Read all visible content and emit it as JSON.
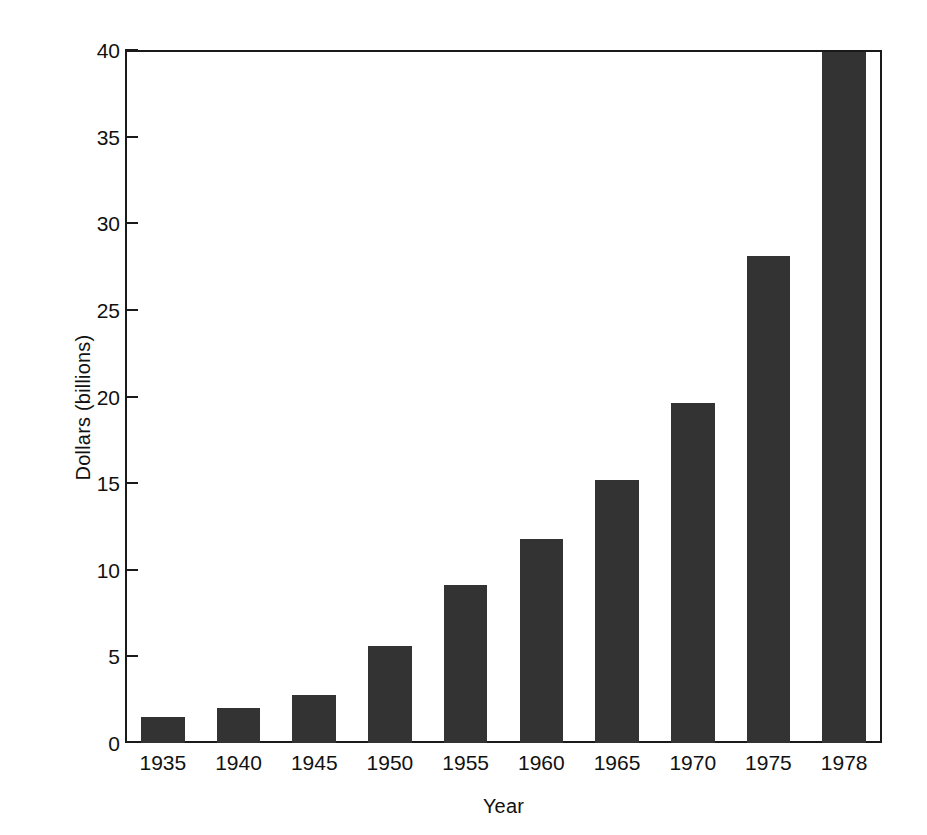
{
  "chart_data": {
    "type": "bar",
    "title": "",
    "subtitle": "",
    "xlabel": "Year",
    "ylabel": "Dollars (billions)",
    "categories": [
      "1935",
      "1940",
      "1945",
      "1950",
      "1955",
      "1960",
      "1965",
      "1970",
      "1975",
      "1978"
    ],
    "values": [
      1.5,
      2.0,
      2.8,
      5.6,
      9.1,
      11.8,
      15.2,
      19.6,
      28.1,
      39.9
    ],
    "series": [
      {
        "name": "Dollars (billions)",
        "values": [
          1.5,
          2.0,
          2.8,
          5.6,
          9.1,
          11.8,
          15.2,
          19.6,
          28.1,
          39.9
        ]
      }
    ],
    "ylim": [
      0,
      40
    ],
    "xlim": [
      0,
      10
    ],
    "yticks": [
      0,
      5,
      10,
      15,
      20,
      25,
      30,
      35,
      40
    ],
    "ytick_labels": [
      "0",
      "5",
      "10",
      "15",
      "20",
      "25",
      "30",
      "35",
      "40"
    ],
    "xtick_labels": [
      "1935",
      "1940",
      "1945",
      "1950",
      "1955",
      "1960",
      "1965",
      "1970",
      "1975",
      "1978"
    ],
    "grid": false,
    "legend": false,
    "legend_position": "none",
    "bar_color": "#333333",
    "axis_color": "#1a1a1a",
    "background_color": "#ffffff",
    "frame": "full-box",
    "annotations": []
  }
}
